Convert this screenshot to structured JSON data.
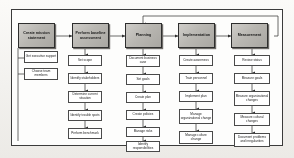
{
  "diagram": {
    "type": "process-flowchart",
    "orientation": "left-to-right",
    "colors": {
      "phase_fill_light": "#cfcdc9",
      "phase_fill_dark": "#a9a7a2",
      "phase_border": "#2e2e2e",
      "task_fill": "#ffffff",
      "task_border": "#4a4a4a",
      "connector": "#3a3a3a",
      "frame_border": "#3b3b3b",
      "page_background": "#f7f6f3"
    },
    "phases": [
      {
        "id": "phase-1",
        "label": "Create mission statement",
        "tasks": [
          {
            "id": "t1-1",
            "label": "Get executive support"
          },
          {
            "id": "t1-2",
            "label": "Choose team members"
          }
        ]
      },
      {
        "id": "phase-2",
        "label": "Perform baseline assessment",
        "tasks": [
          {
            "id": "t2-1",
            "label": "Set scope"
          },
          {
            "id": "t2-2",
            "label": "Identify stakeholders"
          },
          {
            "id": "t2-3",
            "label": "Determine current situation"
          },
          {
            "id": "t2-4",
            "label": "Identify trouble spots"
          },
          {
            "id": "t2-5",
            "label": "Perform benchmark"
          }
        ]
      },
      {
        "id": "phase-3",
        "label": "Planning",
        "tasks": [
          {
            "id": "t3-1",
            "label": "Document business case"
          },
          {
            "id": "t3-2",
            "label": "Set goals"
          },
          {
            "id": "t3-3",
            "label": "Create plan"
          },
          {
            "id": "t3-4",
            "label": "Create policies"
          },
          {
            "id": "t3-5",
            "label": "Manage risks"
          },
          {
            "id": "t3-6",
            "label": "Identify responsibilities"
          }
        ]
      },
      {
        "id": "phase-4",
        "label": "Implementation",
        "tasks": [
          {
            "id": "t4-1",
            "label": "Create awareness"
          },
          {
            "id": "t4-2",
            "label": "Train personnel"
          },
          {
            "id": "t4-3",
            "label": "Implement plan"
          },
          {
            "id": "t4-4",
            "label": "Manage organizational change"
          },
          {
            "id": "t4-5",
            "label": "Manage culture change"
          }
        ]
      },
      {
        "id": "phase-5",
        "label": "Measurement",
        "tasks": [
          {
            "id": "t5-1",
            "label": "Review status"
          },
          {
            "id": "t5-2",
            "label": "Measure goals"
          },
          {
            "id": "t5-3",
            "label": "Measure organizational changes"
          },
          {
            "id": "t5-4",
            "label": "Measure cultural changes"
          },
          {
            "id": "t5-5",
            "label": "Document problems and irregularities"
          }
        ]
      }
    ],
    "feedback_loop": {
      "from": "phase-5",
      "to": "phase-3",
      "label": ""
    }
  }
}
